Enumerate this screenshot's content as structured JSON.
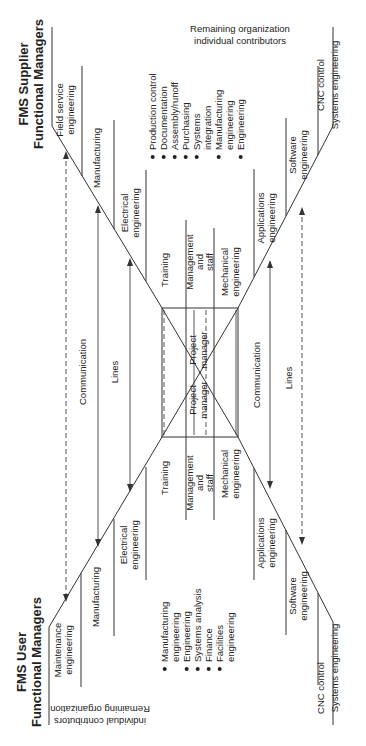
{
  "supplier": {
    "title_line1": "FMS Supplier",
    "title_line2": "Functional Managers",
    "remaining_line1": "Remaining organization",
    "remaining_line2": "individual contributors",
    "bullets": [
      "Production control",
      "Documentation",
      "Assembly/runoff",
      "Purchasing",
      "Systems",
      "integration",
      "Manufacturing",
      "engineering",
      "Engineering"
    ],
    "upper_groups": [
      {
        "l1": "Field service",
        "l2": "engineering"
      },
      {
        "l1": "Manufacturing",
        "l2": ""
      },
      {
        "l1": "Electrical",
        "l2": "engineering"
      },
      {
        "l1": "Training",
        "l2": ""
      }
    ],
    "lower_groups": [
      {
        "l1": "Management",
        "l2": "and",
        "l3": "staff"
      },
      {
        "l1": "Mechanical",
        "l2": "engineering"
      },
      {
        "l1": "Applications",
        "l2": "engineering"
      },
      {
        "l1": "Software",
        "l2": "engineering"
      },
      {
        "l1": "CNC control",
        "l2": "Systems engineering"
      }
    ],
    "project_manager": {
      "l1": "Project",
      "l2": "manager"
    }
  },
  "user": {
    "title_line1": "FMS User",
    "title_line2": "Functional Managers",
    "remaining_line1": "Remaining organization",
    "remaining_line2": "individual contributors",
    "bullets": [
      "Manufacturing",
      "engineering",
      "Engineering",
      "Systems analysis",
      "Finance",
      "Facilities",
      "engineering"
    ],
    "upper_groups": [
      {
        "l1": "Maintenance",
        "l2": "engineering"
      },
      {
        "l1": "Manufacturing",
        "l2": ""
      },
      {
        "l1": "Electrical",
        "l2": "engineering"
      },
      {
        "l1": "Training",
        "l2": ""
      }
    ],
    "lower_groups": [
      {
        "l1": "Management",
        "l2": "and",
        "l3": "staff"
      },
      {
        "l1": "Mechanical",
        "l2": "engineering"
      },
      {
        "l1": "Applications",
        "l2": "engineering"
      },
      {
        "l1": "Software",
        "l2": "engineering"
      },
      {
        "l1": "CNC control",
        "l2": "Systems engineering"
      }
    ],
    "project_manager": {
      "l1": "Project",
      "l2": "manager"
    }
  },
  "links": {
    "upper_communication": "Communication",
    "upper_lines": "Lines",
    "lower_communication": "Communication",
    "lower_lines": "Lines"
  }
}
